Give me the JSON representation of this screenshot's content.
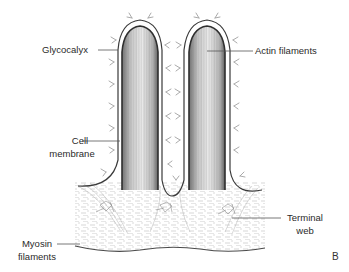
{
  "figure": {
    "panel_letter": "B",
    "colors": {
      "outline": "#3a3a3a",
      "filament": "#9a9a9a",
      "glycocalyx": "#a8a8a8",
      "leader": "#555555",
      "text": "#2a2a2a",
      "background": "#ffffff"
    }
  },
  "labels": {
    "glycocalyx": "Glycocalyx",
    "actin_filaments": "Actin filaments",
    "cell_membrane_line1": "Cell",
    "cell_membrane_line2": "membrane",
    "myosin_line1": "Myosin",
    "myosin_line2": "filaments",
    "terminal_web_line1": "Terminal",
    "terminal_web_line2": "web"
  }
}
